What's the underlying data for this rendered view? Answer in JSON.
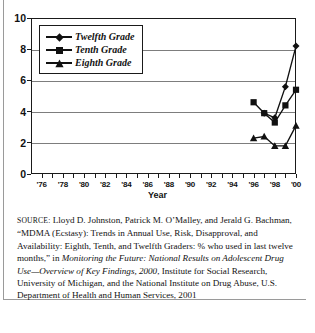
{
  "figure": {
    "axis_title_x": "Year",
    "legend": {
      "items": [
        {
          "label": "Twelfth Grade",
          "marker": "diamond-icon"
        },
        {
          "label": "Tenth Grade",
          "marker": "square-icon"
        },
        {
          "label": "Eighth Grade",
          "marker": "triangle-icon"
        }
      ]
    }
  },
  "chart_data": {
    "type": "line",
    "title": "",
    "xlabel": "Year",
    "ylabel": "",
    "xlim": [
      1975,
      2000
    ],
    "ylim": [
      0,
      10
    ],
    "yticks": [
      "0",
      "2",
      "4",
      "6",
      "8",
      "10"
    ],
    "ytick_values": [
      0,
      2,
      4,
      6,
      8,
      10
    ],
    "xticks": [
      "'76",
      "'78",
      "'80",
      "'82",
      "'84",
      "'86",
      "'88",
      "'90",
      "'92",
      "'94",
      "'96",
      "'98",
      "'00"
    ],
    "xtick_values": [
      1976,
      1978,
      1980,
      1982,
      1984,
      1986,
      1988,
      1990,
      1992,
      1994,
      1996,
      1998,
      2000
    ],
    "minor_xticks_every": 1,
    "grid": "horizontal",
    "legend_position": "upper-left-inside",
    "x": [
      1996,
      1997,
      1998,
      1999,
      2000
    ],
    "series": [
      {
        "name": "Twelfth Grade",
        "marker": "diamond",
        "values": [
          null,
          3.9,
          3.6,
          5.6,
          8.2
        ]
      },
      {
        "name": "Tenth Grade",
        "marker": "square",
        "values": [
          4.6,
          3.9,
          3.3,
          4.4,
          5.4
        ]
      },
      {
        "name": "Eighth Grade",
        "marker": "triangle",
        "values": [
          2.3,
          2.4,
          1.8,
          1.8,
          3.1
        ]
      }
    ]
  },
  "caption": {
    "source_label": "SOURCE:",
    "text_1": " Lloyd D. Johnston, Patrick M. O’Malley, and Jerald G. Bachman, “MDMA (Ecstasy): Trends in Annual Use, Risk, Disapproval, and Availability: Eighth, Tenth, and Twelfth Graders: % who used in last twelve months,” in ",
    "italic_1": "Monitoring the Future: National Results on Adolescent Drug Use—Overview of Key Findings, 2000",
    "text_2": ", Institute for Social Research, University of Michigan, and the National Institute on Drug Abuse, U.S. Department of Health and Human Services, 2001"
  }
}
